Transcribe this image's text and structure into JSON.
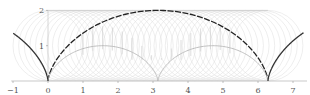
{
  "chart_data": {
    "type": "line",
    "title": "",
    "xlabel": "",
    "ylabel": "",
    "xlim": [
      -1.05,
      7.4
    ],
    "ylim": [
      0,
      2
    ],
    "grid": false,
    "legend": "none",
    "x_ticks": [
      -1,
      0,
      1,
      2,
      3,
      4,
      5,
      6,
      7
    ],
    "x_tick_labels": [
      "−1",
      "0",
      "1",
      "2",
      "3",
      "4",
      "5",
      "6",
      "7"
    ],
    "y_ticks": [
      1,
      2
    ],
    "y_tick_labels": [
      "1",
      "2"
    ],
    "series": [
      {
        "name": "cycloid-left-tail",
        "kind": "parametric",
        "formula": "x = t - sin t, y = 1 - cos t",
        "t_range": [
          -1.93,
          0
        ],
        "style": "solid",
        "color": "#333333"
      },
      {
        "name": "cycloid-main-arch",
        "kind": "parametric",
        "formula": "x = t - sin t, y = 1 - cos t",
        "t_range": [
          0,
          6.2832
        ],
        "style": "dashed",
        "color": "#222222"
      },
      {
        "name": "cycloid-right-tail",
        "kind": "parametric",
        "formula": "x = t - sin t, y = 1 - cos t",
        "t_range": [
          6.2832,
          8.23
        ],
        "style": "solid",
        "color": "#333333"
      },
      {
        "name": "inner-arch-1",
        "kind": "parametric",
        "formula": "x = (t - sin t)/2, y = (1 - cos t)/2",
        "t_range": [
          0,
          6.2832
        ],
        "style": "solid",
        "color": "#b8b8b8"
      },
      {
        "name": "inner-arch-2",
        "kind": "parametric",
        "formula": "x = pi + (t - sin t)/2, y = (1 - cos t)/2",
        "t_range": [
          0,
          6.2832
        ],
        "style": "solid",
        "color": "#b8b8b8"
      }
    ],
    "rolling_circles": {
      "radius": 1,
      "center_y": 1,
      "center_x_from": 0,
      "center_x_to": 6.2832,
      "count": 40,
      "color": "#dddddd"
    },
    "chords": {
      "x_from": 1.0,
      "x_to": 5.2,
      "count": 16,
      "color": "#c8c8c8"
    },
    "helper_lines": [
      {
        "name": "top-line",
        "x": [
          0,
          6.2832
        ],
        "y": [
          2,
          2
        ],
        "color": "#cccccc"
      },
      {
        "name": "y-axis-line",
        "x": [
          0,
          0
        ],
        "y": [
          0,
          2
        ],
        "color": "#cccccc"
      },
      {
        "name": "x-axis-line",
        "x": [
          -1.05,
          7.4
        ],
        "y": [
          0,
          0
        ],
        "color": "#bbbbbb"
      }
    ]
  }
}
